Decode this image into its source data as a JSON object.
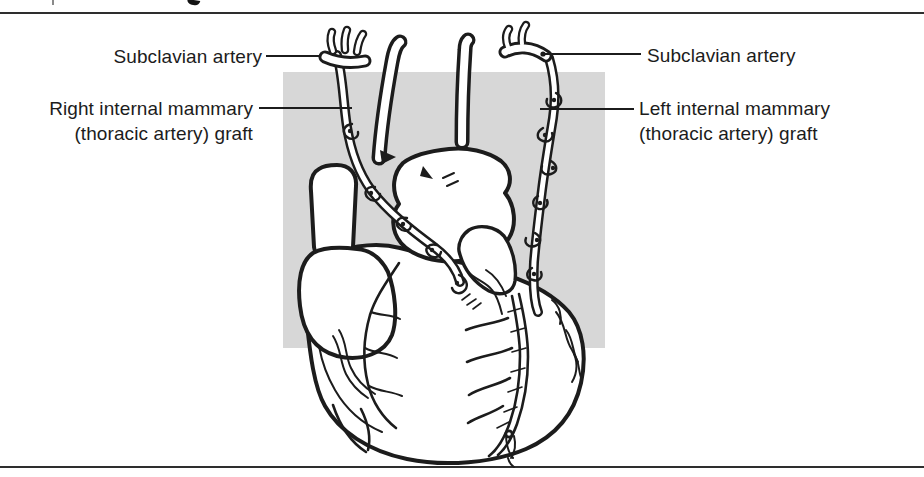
{
  "figure": {
    "type": "anatomical-line-drawing",
    "labels": {
      "subclavian_left": "Subclavian artery",
      "subclavian_right": "Subclavian artery",
      "rima_line1": "Right internal mammary",
      "rima_line2": "(thoracic artery) graft",
      "lima_line1": "Left internal mammary",
      "lima_line2": "(thoracic artery) graft"
    },
    "colors": {
      "ink": "#1c1c1c",
      "panel": "#d7d7d7",
      "bg": "#ffffff"
    }
  }
}
